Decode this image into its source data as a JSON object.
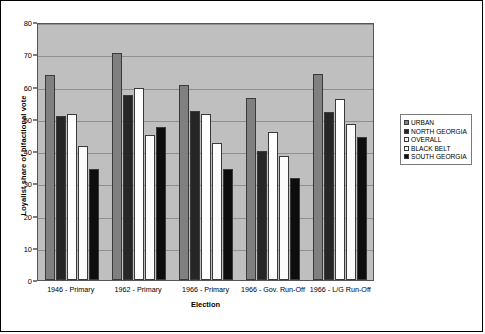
{
  "chart_data": {
    "type": "bar",
    "title": "",
    "xlabel": "Election",
    "ylabel": "Loyalist share of bifactional vote",
    "ylim": [
      0,
      80
    ],
    "ytick_step": 10,
    "yticks": [
      0,
      10,
      20,
      30,
      40,
      50,
      60,
      70,
      80
    ],
    "grid": true,
    "legend_position": "right",
    "categories": [
      "1946 - Primary",
      "1962 - Primary",
      "1966 - Primary",
      "1966 - Gov. Run-Off",
      "1966 - L/G Run-Off"
    ],
    "series": [
      {
        "name": "URBAN",
        "color": "#808080",
        "values": [
          63.5,
          70.5,
          60.5,
          56.5,
          64.0
        ]
      },
      {
        "name": "NORTH GEORGIA",
        "color": "#262626",
        "values": [
          51.0,
          57.5,
          52.5,
          40.0,
          52.0
        ]
      },
      {
        "name": "OVERALL",
        "color": "#ffffff",
        "values": [
          51.5,
          59.5,
          51.5,
          46.0,
          56.0
        ]
      },
      {
        "name": "BLACK BELT",
        "color": "#fbfbfb",
        "values": [
          41.5,
          45.0,
          42.5,
          38.5,
          48.5
        ]
      },
      {
        "name": "SOUTH GEORGIA",
        "color": "#0d0d0d",
        "values": [
          34.5,
          47.5,
          34.5,
          31.5,
          44.5
        ]
      }
    ]
  },
  "figure": {
    "plot_background": "#bfbfbf",
    "border_color": "#000000"
  }
}
